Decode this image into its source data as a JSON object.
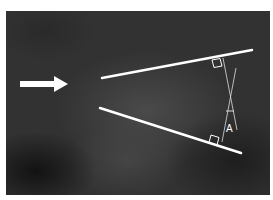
{
  "image": {
    "description": "Grayscale radiograph with white annotation lines forming a converging wedge, an arrow pointing at the apex, and a measured angle labeled A",
    "annotations": {
      "arrow": {
        "direction": "right"
      },
      "angle_label": "A",
      "line_color": "#ffffff",
      "background_color": "#323232"
    }
  }
}
